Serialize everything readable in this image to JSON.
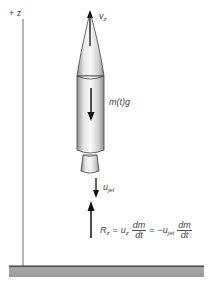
{
  "diagram": {
    "axis": {
      "label": "+ z"
    },
    "rocket": {
      "velocity_label": {
        "symbol": "v",
        "subscript": "z"
      },
      "weight_label": "m(t)g"
    },
    "jet": {
      "symbol": "u",
      "subscript": "jet"
    },
    "reaction": {
      "lhs": {
        "symbol": "R",
        "subscript": "z"
      },
      "eq1": "=",
      "term1": {
        "symbol": "u",
        "subscript": "z"
      },
      "frac1": {
        "num": "dm",
        "den": "dt"
      },
      "eq2": "=",
      "term2": {
        "sign": "−",
        "symbol": "u",
        "subscript": "jet"
      },
      "frac2": {
        "num": "dm",
        "den": "dt"
      }
    },
    "colors": {
      "ink": "#222222",
      "axis": "#6a6a6a",
      "ground": "#9a9a9a",
      "rocket_light": "#f4f4f4",
      "rocket_shade": "#8c8c8c"
    }
  }
}
